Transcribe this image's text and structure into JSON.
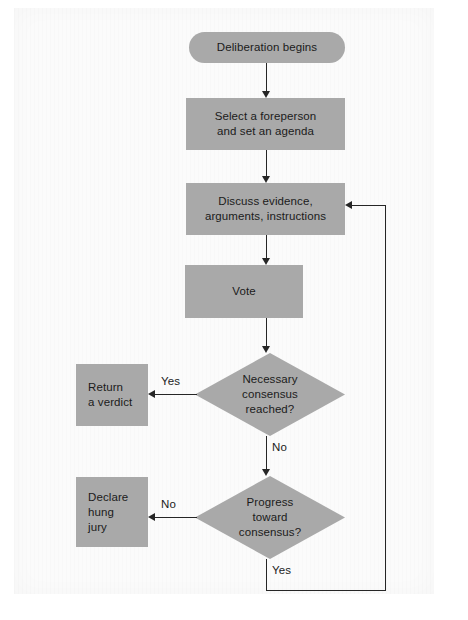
{
  "diagram": {
    "type": "flowchart",
    "fill_color": "#a9a9a9",
    "line_color": "#262626",
    "text_color": "#1b1b1b",
    "background_color": "#fbfbfb"
  },
  "nodes": {
    "start": {
      "label": "Deliberation begins",
      "shape": "rounded-rectangle"
    },
    "foreperson": {
      "line1": "Select a foreperson",
      "line2": "and set an agenda",
      "shape": "rectangle"
    },
    "discuss": {
      "line1": "Discuss evidence,",
      "line2": "arguments, instructions",
      "shape": "rectangle"
    },
    "vote": {
      "label": "Vote",
      "shape": "rectangle"
    },
    "consensus_decision": {
      "line1": "Necessary",
      "line2": "consensus",
      "line3": "reached?",
      "shape": "diamond"
    },
    "verdict": {
      "line1": "Return",
      "line2": "a verdict",
      "shape": "rectangle"
    },
    "progress_decision": {
      "line1": "Progress",
      "line2": "toward",
      "line3": "consensus?",
      "shape": "diamond"
    },
    "hung_jury": {
      "line1": "Declare",
      "line2": "hung",
      "line3": "jury",
      "shape": "rectangle"
    }
  },
  "edges": {
    "consensus_yes": "Yes",
    "consensus_no": "No",
    "progress_no": "No",
    "progress_yes": "Yes"
  }
}
